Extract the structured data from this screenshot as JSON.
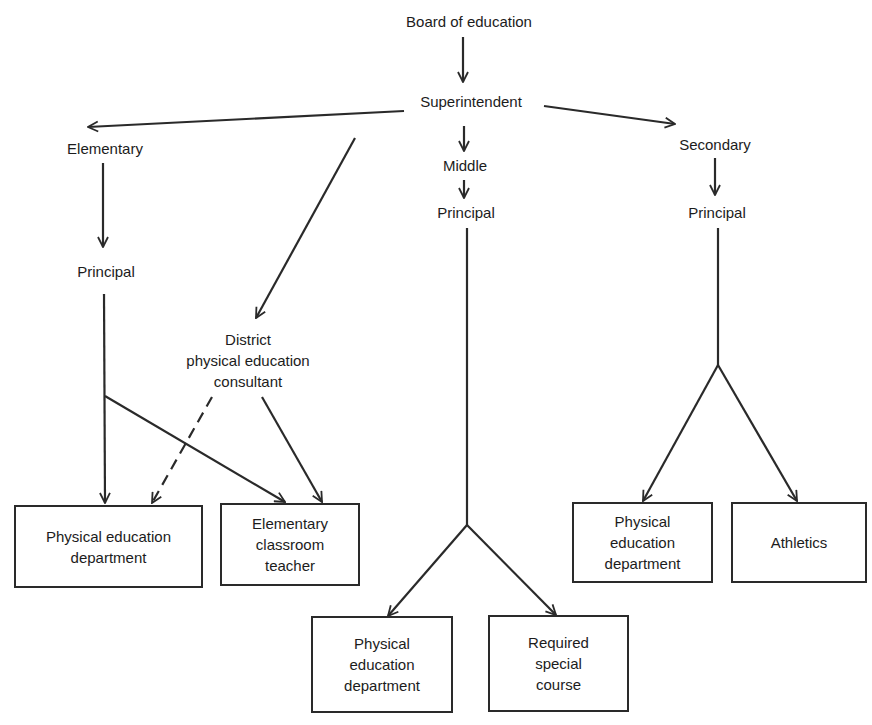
{
  "diagram": {
    "nodes": {
      "board": "Board of education",
      "superintendent": "Superintendent",
      "elementary": "Elementary",
      "middle": "Middle",
      "secondary": "Secondary",
      "elem_principal": "Principal",
      "middle_principal": "Principal",
      "sec_principal": "Principal",
      "consultant": [
        "District",
        "physical education",
        "consultant"
      ],
      "elem_pe_dept": [
        "Physical education",
        "department"
      ],
      "elem_teacher": [
        "Elementary",
        "classroom",
        "teacher"
      ],
      "middle_pe_dept": [
        "Physical",
        "education",
        "department"
      ],
      "middle_required": [
        "Required",
        "special",
        "course"
      ],
      "sec_pe_dept": [
        "Physical",
        "education",
        "department"
      ],
      "sec_athletics": [
        "Athletics"
      ]
    },
    "edges": [
      {
        "from": "Board of education",
        "to": "Superintendent",
        "style": "solid"
      },
      {
        "from": "Superintendent",
        "to": "Elementary",
        "style": "solid"
      },
      {
        "from": "Superintendent",
        "to": "Middle",
        "style": "solid"
      },
      {
        "from": "Superintendent",
        "to": "Secondary",
        "style": "solid"
      },
      {
        "from": "Superintendent",
        "to": "District physical education consultant",
        "style": "solid"
      },
      {
        "from": "Elementary",
        "to": "Principal (elementary)",
        "style": "solid"
      },
      {
        "from": "Principal (elementary)",
        "to": "Physical education department",
        "style": "solid"
      },
      {
        "from": "Principal (elementary)",
        "to": "Elementary classroom teacher",
        "style": "solid"
      },
      {
        "from": "District physical education consultant",
        "to": "Physical education department",
        "style": "dashed"
      },
      {
        "from": "District physical education consultant",
        "to": "Elementary classroom teacher",
        "style": "solid"
      },
      {
        "from": "Middle",
        "to": "Principal (middle)",
        "style": "solid"
      },
      {
        "from": "Principal (middle)",
        "to": "Physical education department (middle)",
        "style": "solid"
      },
      {
        "from": "Principal (middle)",
        "to": "Required special course",
        "style": "solid"
      },
      {
        "from": "Secondary",
        "to": "Principal (secondary)",
        "style": "solid"
      },
      {
        "from": "Principal (secondary)",
        "to": "Physical education department (secondary)",
        "style": "solid"
      },
      {
        "from": "Principal (secondary)",
        "to": "Athletics",
        "style": "solid"
      }
    ],
    "colors": {
      "line": "#2a2a2a",
      "text": "#1c1c1c",
      "background": "#ffffff"
    }
  }
}
